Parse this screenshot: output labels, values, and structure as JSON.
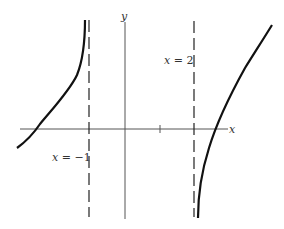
{
  "diagram": {
    "type": "function-graph",
    "axes": {
      "x_label": "x",
      "y_label": "y",
      "color": "#555555"
    },
    "asymptotes": [
      {
        "label_var": "x",
        "label_eq": " = −1",
        "value": -1
      },
      {
        "label_var": "x",
        "label_eq": " = 2",
        "value": 2
      }
    ],
    "tick_marks": [
      1
    ],
    "curves": [
      {
        "name": "left-branch",
        "description": "rises from lower-left, crosses x-axis, goes to +infinity approaching x = −1"
      },
      {
        "name": "right-branch",
        "description": "rises from −infinity near x = 2, crosses x-axis, continues up to the right"
      }
    ],
    "curve_color": "#111111"
  }
}
